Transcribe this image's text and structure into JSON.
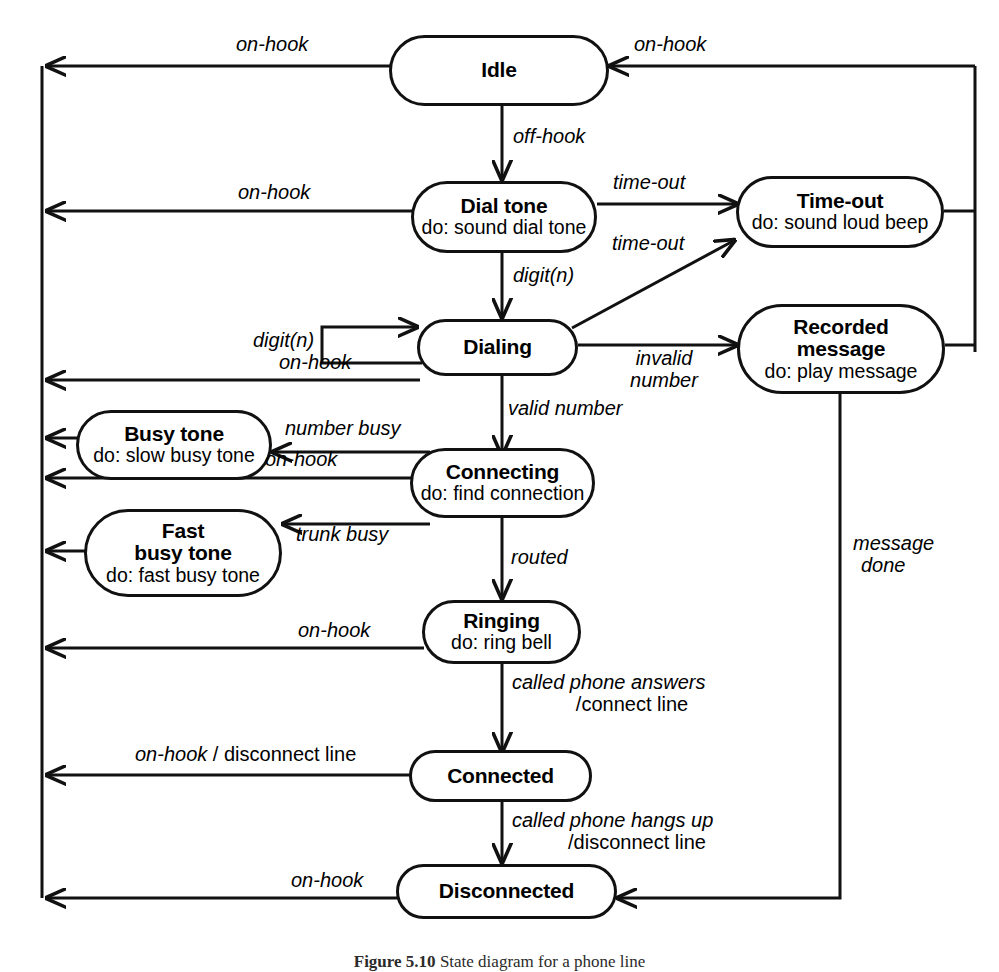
{
  "figure": {
    "caption_bold": "Figure 5.10",
    "caption_rest": "State diagram for a phone line"
  },
  "diagram": {
    "type": "uml-state-diagram",
    "states": [
      {
        "id": "idle",
        "name": "Idle",
        "activity": ""
      },
      {
        "id": "dial_tone",
        "name": "Dial tone",
        "activity": "do: sound dial tone"
      },
      {
        "id": "time_out",
        "name": "Time-out",
        "activity": "do: sound loud beep"
      },
      {
        "id": "dialing",
        "name": "Dialing",
        "activity": ""
      },
      {
        "id": "recorded",
        "name": "Recorded message",
        "name_line1": "Recorded",
        "name_line2": "message",
        "activity": "do: play message"
      },
      {
        "id": "busy",
        "name": "Busy tone",
        "activity": "do: slow busy tone"
      },
      {
        "id": "connecting",
        "name": "Connecting",
        "activity": "do: find connection"
      },
      {
        "id": "fast_busy",
        "name": "Fast busy tone",
        "name_line1": "Fast",
        "name_line2": "busy tone",
        "activity": "do: fast busy tone"
      },
      {
        "id": "ringing",
        "name": "Ringing",
        "activity": "do: ring bell"
      },
      {
        "id": "connected",
        "name": "Connected",
        "activity": ""
      },
      {
        "id": "disconnected",
        "name": "Disconnected",
        "activity": ""
      }
    ],
    "transitions": [
      {
        "from": "idle",
        "to": "left_bus",
        "event": "on-hook",
        "label": "on-hook"
      },
      {
        "from": "right_bus",
        "to": "idle",
        "event": "on-hook",
        "label": "on-hook"
      },
      {
        "from": "idle",
        "to": "dial_tone",
        "event": "off-hook",
        "label": "off-hook"
      },
      {
        "from": "dial_tone",
        "to": "left_bus",
        "event": "on-hook",
        "label": "on-hook"
      },
      {
        "from": "dial_tone",
        "to": "time_out",
        "event": "time-out",
        "label": "time-out"
      },
      {
        "from": "dial_tone",
        "to": "dialing",
        "event": "digit(n)",
        "label": "digit(n)"
      },
      {
        "from": "dialing",
        "to": "time_out",
        "event": "time-out",
        "label": "time-out"
      },
      {
        "from": "dialing",
        "to": "dialing",
        "event": "digit(n)",
        "label": "digit(n)"
      },
      {
        "from": "dialing",
        "to": "recorded",
        "event": "invalid number",
        "label_line1": "invalid",
        "label_line2": "number"
      },
      {
        "from": "dialing",
        "to": "left_bus",
        "event": "on-hook",
        "label": "on-hook"
      },
      {
        "from": "dialing",
        "to": "connecting",
        "event": "valid number",
        "label": "valid number"
      },
      {
        "from": "connecting",
        "to": "busy",
        "event": "number busy",
        "label": "number busy"
      },
      {
        "from": "connecting",
        "to": "left_bus",
        "event": "on-hook",
        "label": "on-hook"
      },
      {
        "from": "connecting",
        "to": "fast_busy",
        "event": "trunk busy",
        "label": "trunk busy"
      },
      {
        "from": "connecting",
        "to": "ringing",
        "event": "routed",
        "label": "routed"
      },
      {
        "from": "ringing",
        "to": "left_bus",
        "event": "on-hook",
        "label": "on-hook"
      },
      {
        "from": "ringing",
        "to": "connected",
        "event": "called phone answers",
        "label_line1": "called phone answers",
        "label_line2": "/connect line"
      },
      {
        "from": "connected",
        "to": "left_bus",
        "event": "on-hook",
        "action": "/ disconnect line",
        "label": "on-hook",
        "label_action": " / disconnect line"
      },
      {
        "from": "connected",
        "to": "disconnected",
        "event": "called phone hangs up",
        "label_line1": "called phone hangs up",
        "label_line2": "/disconnect line"
      },
      {
        "from": "disconnected",
        "to": "left_bus",
        "event": "on-hook",
        "label": "on-hook"
      },
      {
        "from": "recorded",
        "to": "disconnected",
        "event": "message done",
        "label_line1": "message",
        "label_line2": "done"
      },
      {
        "from": "busy",
        "to": "left_bus",
        "event": "",
        "label": ""
      },
      {
        "from": "fast_busy",
        "to": "left_bus",
        "event": "",
        "label": ""
      },
      {
        "from": "time_out",
        "to": "right_bus",
        "event": "",
        "label": ""
      },
      {
        "from": "recorded",
        "to": "right_bus",
        "event": "",
        "label": ""
      }
    ]
  }
}
